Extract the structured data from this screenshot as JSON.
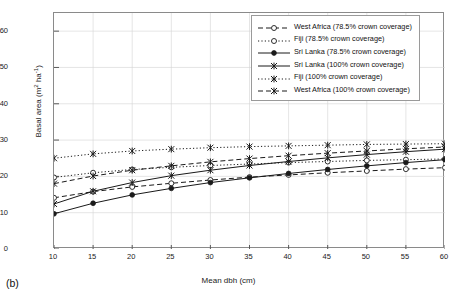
{
  "panel": {
    "label": "(b)"
  },
  "chart_data": {
    "type": "line",
    "title": "",
    "xlabel": "Mean dbh (cm)",
    "ylabel": "Basal area (m2 ha-1)",
    "ylabel_display": "Basal area (m",
    "ylabel_sup1": "2",
    "ylabel_mid": " ha",
    "ylabel_sup2": "-1",
    "ylabel_end": ")",
    "xlim": [
      10,
      60
    ],
    "ylim": [
      0,
      65
    ],
    "yticks": [
      0,
      10,
      20,
      30,
      40,
      50,
      60
    ],
    "xticks": [
      10,
      15,
      20,
      25,
      30,
      35,
      40,
      45,
      50,
      55,
      60
    ],
    "grid": true,
    "legend_position": "top-right",
    "x": [
      10,
      15,
      20,
      25,
      30,
      35,
      40,
      45,
      50,
      55,
      60
    ],
    "series": [
      {
        "name": "West Africa (78.5% crown coverage)",
        "style": "dashed",
        "marker": "open-circle",
        "color": "#1a1a1a",
        "values": [
          14.1,
          15.8,
          17.1,
          18.1,
          19.0,
          19.8,
          20.4,
          21.0,
          21.5,
          22.0,
          22.4
        ]
      },
      {
        "name": "Fiji (78.5% crown coverage)",
        "style": "dotted",
        "marker": "open-circle",
        "color": "#1a1a1a",
        "values": [
          19.7,
          21.0,
          21.9,
          22.5,
          23.0,
          23.4,
          23.8,
          24.1,
          24.4,
          24.6,
          24.8
        ]
      },
      {
        "name": "Sri Lanka (78.5% crown coverage)",
        "style": "solid",
        "marker": "filled-circle",
        "color": "#1a1a1a",
        "values": [
          9.7,
          12.6,
          14.9,
          16.7,
          18.3,
          19.6,
          20.8,
          21.9,
          22.9,
          23.8,
          24.6
        ]
      },
      {
        "name": "Sri Lanka (100% crown coverage)",
        "style": "solid",
        "marker": "star",
        "color": "#1a1a1a",
        "values": [
          12.4,
          15.9,
          18.3,
          20.2,
          21.7,
          23.0,
          24.1,
          25.1,
          26.0,
          26.8,
          27.5
        ]
      },
      {
        "name": "Fiji (100% crown coverage)",
        "style": "dotted",
        "marker": "star",
        "color": "#1a1a1a",
        "values": [
          25.0,
          26.2,
          27.0,
          27.5,
          27.9,
          28.2,
          28.4,
          28.6,
          28.8,
          28.9,
          29.0
        ]
      },
      {
        "name": "West Africa (100% crown coverage)",
        "style": "dashed",
        "marker": "star",
        "color": "#1a1a1a",
        "values": [
          18.0,
          20.1,
          21.7,
          22.9,
          24.0,
          24.9,
          25.7,
          26.4,
          27.0,
          27.6,
          28.1
        ]
      }
    ]
  }
}
